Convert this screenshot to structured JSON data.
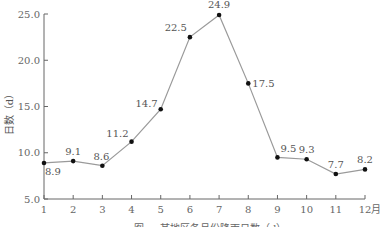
{
  "chart_data": {
    "type": "line",
    "title": "",
    "caption": "图 — 某地区各月份降雨日数（d）",
    "xlabel": "月",
    "ylabel": "日数（d）",
    "categories": [
      "1",
      "2",
      "3",
      "4",
      "5",
      "6",
      "7",
      "8",
      "9",
      "10",
      "11",
      "12"
    ],
    "x_unit": "月",
    "series": [
      {
        "name": "日数",
        "values": [
          8.9,
          9.1,
          8.6,
          11.2,
          14.7,
          22.5,
          24.9,
          17.5,
          9.5,
          9.3,
          7.7,
          8.2
        ]
      }
    ],
    "value_labels": [
      "8.9",
      "9.1",
      "8.6",
      "11.2",
      "14.7",
      "22.5",
      "24.9",
      "17.5",
      "9.5",
      "9.3",
      "7.7",
      "8.2"
    ],
    "ylim": [
      5.0,
      25.0
    ],
    "yticks": [
      "5.0",
      "10.0",
      "15.0",
      "20.0",
      "25.0"
    ],
    "grid": false,
    "legend": "none",
    "colors": {
      "line": "#9a9a9a",
      "marker": "#111111",
      "axis": "#666666"
    }
  }
}
